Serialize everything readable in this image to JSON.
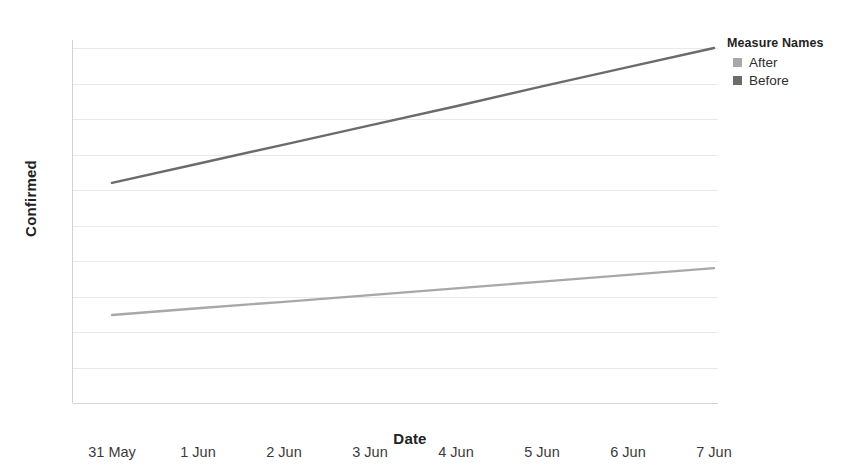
{
  "chart_data": {
    "type": "line",
    "title": "",
    "xlabel": "Date",
    "ylabel": "Confirmed",
    "x": [
      "31 May",
      "1 Jun",
      "2 Jun",
      "3 Jun",
      "4 Jun",
      "5 Jun",
      "6 Jun",
      "7 Jun"
    ],
    "ylim": [
      0.0,
      1.0
    ],
    "ytick_labels": [
      "1.0",
      "0.9",
      "0.8",
      "0.7",
      "0.6",
      "0.5",
      "0.4",
      "0.3",
      "0.2",
      "0.1",
      "0.0"
    ],
    "ytick_values": [
      1.0,
      0.9,
      0.8,
      0.7,
      0.6,
      0.5,
      0.4,
      0.3,
      0.2,
      0.1,
      0.0
    ],
    "grid": true,
    "legend_position": "right",
    "series": [
      {
        "name": "Before",
        "color": "#6b6b6b",
        "values": [
          0.62,
          0.674,
          0.728,
          0.782,
          0.836,
          0.892,
          0.946,
          1.0
        ]
      },
      {
        "name": "After",
        "color": "#a8a8a8",
        "values": [
          0.248,
          0.267,
          0.285,
          0.304,
          0.323,
          0.342,
          0.361,
          0.38
        ]
      }
    ]
  },
  "legend": {
    "title": "Measure Names",
    "items": [
      {
        "label": "After",
        "color": "#a8a8a8"
      },
      {
        "label": "Before",
        "color": "#6b6b6b"
      }
    ]
  },
  "colors": {
    "gridline": "#e9e9e9",
    "axis": "#d2d2d2",
    "text": "#2b2b2b"
  }
}
